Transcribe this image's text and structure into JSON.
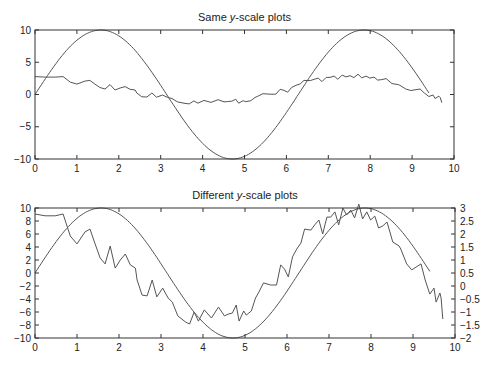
{
  "figure": {
    "width": 493,
    "height": 367
  },
  "chart_data": [
    {
      "type": "line",
      "title": "Same y-scale plots",
      "title_parts": [
        "Same ",
        "y",
        "-scale plots"
      ],
      "xlabel": "",
      "ylabel": "",
      "xlim": [
        0,
        10
      ],
      "ylim": [
        -10,
        10
      ],
      "xticks": [
        0,
        1,
        2,
        3,
        4,
        5,
        6,
        7,
        8,
        9,
        10
      ],
      "yticks": [
        -10,
        -5,
        0,
        5,
        10
      ],
      "grid": false,
      "box": {
        "left": 35,
        "top": 30,
        "right": 454,
        "bottom": 159
      },
      "series": [
        {
          "name": "10*sin(x)",
          "kind": "function",
          "expr": "10sin",
          "x_range": [
            0,
            9.42
          ],
          "color": "#555555"
        },
        {
          "name": "noisy signal",
          "kind": "ref",
          "ref": "noise"
        }
      ]
    },
    {
      "type": "line",
      "title": "Different y-scale plots",
      "title_parts": [
        "Different ",
        "y",
        "-scale plots"
      ],
      "xlabel": "",
      "ylabel": "",
      "xlim": [
        0,
        10
      ],
      "ylim": [
        -10,
        10
      ],
      "ylim_right": [
        -2,
        3
      ],
      "xticks": [
        0,
        1,
        2,
        3,
        4,
        5,
        6,
        7,
        8,
        9,
        10
      ],
      "yticks": [
        -10,
        -8,
        -6,
        -4,
        -2,
        0,
        2,
        4,
        6,
        8,
        10
      ],
      "yticks_right": [
        -2,
        -1.5,
        -1,
        -0.5,
        0,
        0.5,
        1,
        1.5,
        2,
        2.5,
        3
      ],
      "grid": false,
      "box": {
        "left": 35,
        "top": 208,
        "right": 455,
        "bottom": 338
      },
      "series": [
        {
          "name": "10*sin(x)",
          "axis": "left",
          "kind": "function",
          "expr": "10sin",
          "x_range": [
            0,
            9.42
          ],
          "color": "#555555"
        },
        {
          "name": "noisy signal",
          "axis": "right",
          "kind": "ref",
          "ref": "noise"
        }
      ]
    }
  ],
  "noise": {
    "color": "#555555",
    "x": [
      0,
      0.24,
      0.48,
      0.67,
      0.84,
      1.0,
      1.19,
      1.31,
      1.43,
      1.55,
      1.67,
      1.79,
      1.91,
      2.03,
      2.15,
      2.27,
      2.39,
      2.43,
      2.55,
      2.67,
      2.79,
      2.9,
      3.04,
      3.17,
      3.27,
      3.4,
      3.58,
      3.68,
      3.79,
      3.89,
      4.03,
      4.2,
      4.37,
      4.51,
      4.6,
      4.7,
      4.79,
      4.86,
      4.97,
      5.03,
      5.15,
      5.25,
      5.32,
      5.44,
      5.61,
      5.75,
      5.85,
      5.94,
      6.03,
      6.13,
      6.23,
      6.33,
      6.42,
      6.57,
      6.66,
      6.76,
      6.85,
      6.95,
      7.04,
      7.14,
      7.23,
      7.33,
      7.42,
      7.52,
      7.61,
      7.71,
      7.8,
      7.9,
      7.99,
      8.09,
      8.18,
      8.28,
      8.38,
      8.52,
      8.67,
      8.71,
      8.85,
      8.97,
      9.19,
      9.29,
      9.4,
      9.5,
      9.55,
      9.64,
      9.67,
      9.71
    ],
    "y": [
      2.77,
      2.7,
      2.7,
      2.77,
      1.92,
      1.62,
      2.08,
      2.19,
      1.62,
      1.08,
      0.85,
      1.54,
      0.69,
      1.0,
      1.23,
      0.81,
      0.69,
      0.23,
      -0.35,
      -0.38,
      0.23,
      -0.42,
      -0.08,
      -0.46,
      -0.62,
      -1.15,
      -1.38,
      -1.46,
      -1.0,
      -1.35,
      -0.92,
      -1.23,
      -0.81,
      -1.15,
      -1.08,
      -1.04,
      -0.73,
      -1.35,
      -0.96,
      -1.12,
      -0.96,
      -0.46,
      -0.27,
      0.12,
      0.04,
      0.04,
      0.81,
      0.65,
      0.35,
      1.12,
      1.42,
      1.65,
      2.19,
      2.15,
      2.35,
      2.54,
      2.0,
      2.65,
      2.65,
      2.85,
      2.35,
      3.0,
      2.73,
      2.92,
      2.62,
      3.15,
      2.58,
      2.85,
      2.54,
      2.69,
      2.23,
      2.31,
      2.46,
      1.69,
      1.54,
      1.42,
      0.85,
      0.62,
      0.85,
      0.23,
      -0.31,
      -0.08,
      -0.62,
      -0.27,
      -0.46,
      -1.27
    ],
    "y_top_scale_note": "same data plotted on left -10..10 scale in top panel"
  }
}
